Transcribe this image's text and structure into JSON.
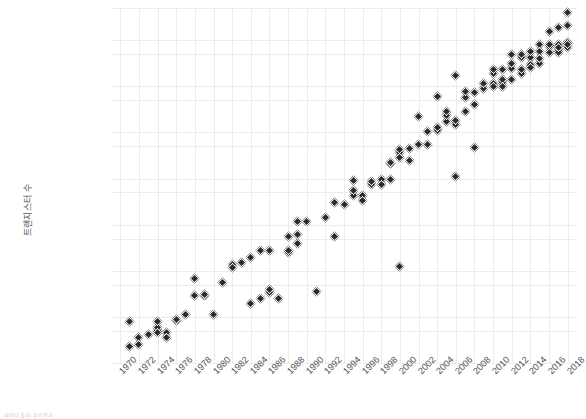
{
  "chart_data": {
    "type": "scatter",
    "title": "",
    "xlabel": "",
    "ylabel": "트랜지스터 수",
    "yscale": "log",
    "ylim": [
      1000,
      50000000000
    ],
    "xlim": [
      1969,
      2019
    ],
    "grid": true,
    "legend": null,
    "marker": "diamond",
    "marker_color": "#2b2b2b",
    "ytick_labels": [
      "50,000,000,000",
      "10,000,000,000",
      "5,000,000,000",
      "1,000,000,000",
      "500,000,000",
      "100,000,000",
      "50,000,000",
      "10,000,000",
      "5,000,000",
      "1,000,000",
      "500,000",
      "100,000",
      "50,000",
      "10,000",
      "5,000",
      "1,000"
    ],
    "ytick_values": [
      50000000000,
      10000000000,
      5000000000,
      1000000000,
      500000000,
      100000000,
      50000000,
      10000000,
      5000000,
      1000000,
      500000,
      100000,
      50000,
      10000,
      5000,
      1000
    ],
    "xtick_labels": [
      "1970",
      "1972",
      "1974",
      "1976",
      "1978",
      "1980",
      "1982",
      "1984",
      "1986",
      "1988",
      "1990",
      "1992",
      "1994",
      "1996",
      "1998",
      "2000",
      "2002",
      "2004",
      "2006",
      "2008",
      "2010",
      "2012",
      "2014",
      "2016",
      "2018"
    ],
    "xtick_values": [
      1970,
      1972,
      1974,
      1976,
      1978,
      1980,
      1982,
      1984,
      1986,
      1988,
      1990,
      1992,
      1994,
      1996,
      1998,
      2000,
      2002,
      2004,
      2006,
      2008,
      2010,
      2012,
      2014,
      2016,
      2018
    ],
    "points": [
      [
        1971,
        2250
      ],
      [
        1971,
        8000
      ],
      [
        1972,
        3500
      ],
      [
        1972,
        2500
      ],
      [
        1973,
        4100
      ],
      [
        1974,
        5000
      ],
      [
        1974,
        6000
      ],
      [
        1974,
        4500
      ],
      [
        1974,
        8000
      ],
      [
        1975,
        4528
      ],
      [
        1975,
        3510
      ],
      [
        1976,
        8500
      ],
      [
        1976,
        9000
      ],
      [
        1977,
        11000
      ],
      [
        1978,
        29000
      ],
      [
        1978,
        68000
      ],
      [
        1979,
        29000
      ],
      [
        1979,
        30000
      ],
      [
        1980,
        11500
      ],
      [
        1981,
        55000
      ],
      [
        1982,
        134000
      ],
      [
        1982,
        120000
      ],
      [
        1983,
        150000
      ],
      [
        1984,
        190000
      ],
      [
        1984,
        20000
      ],
      [
        1985,
        25000
      ],
      [
        1985,
        275000
      ],
      [
        1986,
        273000
      ],
      [
        1986,
        34000
      ],
      [
        1986,
        40000
      ],
      [
        1987,
        25000
      ],
      [
        1988,
        250000
      ],
      [
        1988,
        275000
      ],
      [
        1988,
        550000
      ],
      [
        1989,
        1180000
      ],
      [
        1989,
        390000
      ],
      [
        1989,
        600000
      ],
      [
        1990,
        1200000
      ],
      [
        1991,
        35000
      ],
      [
        1992,
        1400000
      ],
      [
        1993,
        3100000
      ],
      [
        1993,
        550000
      ],
      [
        1994,
        2800000
      ],
      [
        1995,
        4300000
      ],
      [
        1995,
        5500000
      ],
      [
        1995,
        9300000
      ],
      [
        1996,
        4300000
      ],
      [
        1996,
        3300000
      ],
      [
        1997,
        7500000
      ],
      [
        1997,
        8800000
      ],
      [
        1998,
        9500000
      ],
      [
        1998,
        7500000
      ],
      [
        1999,
        9500000
      ],
      [
        1999,
        21300000
      ],
      [
        1999,
        22000000
      ],
      [
        2000,
        37500000
      ],
      [
        2000,
        42000000
      ],
      [
        2000,
        28000000
      ],
      [
        2000,
        125000
      ],
      [
        2001,
        45000000
      ],
      [
        2001,
        25000000
      ],
      [
        2002,
        55000000
      ],
      [
        2002,
        220000000
      ],
      [
        2003,
        105000000
      ],
      [
        2003,
        54000000
      ],
      [
        2004,
        112000000
      ],
      [
        2004,
        125000000
      ],
      [
        2004,
        592000000
      ],
      [
        2005,
        169000000
      ],
      [
        2005,
        228000000
      ],
      [
        2005,
        291000000
      ],
      [
        2006,
        151000000
      ],
      [
        2006,
        184000000
      ],
      [
        2006,
        1700000000
      ],
      [
        2006,
        11000000
      ],
      [
        2007,
        291000000
      ],
      [
        2007,
        582000000
      ],
      [
        2007,
        789000000
      ],
      [
        2008,
        731000000
      ],
      [
        2008,
        410000000
      ],
      [
        2008,
        47000000
      ],
      [
        2009,
        904000000
      ],
      [
        2009,
        1170000000
      ],
      [
        2010,
        1170000000
      ],
      [
        2010,
        1900000000
      ],
      [
        2010,
        2300000000
      ],
      [
        2010,
        1000000000
      ],
      [
        2011,
        1200000000
      ],
      [
        2011,
        2270000000
      ],
      [
        2011,
        1400000000
      ],
      [
        2011,
        995000000
      ],
      [
        2012,
        1400000000
      ],
      [
        2012,
        2400000000
      ],
      [
        2012,
        3100000000
      ],
      [
        2012,
        5000000000
      ],
      [
        2013,
        1860000000
      ],
      [
        2013,
        4310000000
      ],
      [
        2013,
        5000000000
      ],
      [
        2013,
        2300000000
      ],
      [
        2014,
        4310000000
      ],
      [
        2014,
        5560000000
      ],
      [
        2014,
        3000000000
      ],
      [
        2014,
        2600000000
      ],
      [
        2015,
        8000000000
      ],
      [
        2015,
        5700000000
      ],
      [
        2015,
        3200000000
      ],
      [
        2015,
        4000000000
      ],
      [
        2016,
        7200000000
      ],
      [
        2016,
        15300000000
      ],
      [
        2016,
        8000000000
      ],
      [
        2016,
        5500000000
      ],
      [
        2017,
        19200000000
      ],
      [
        2017,
        8000000000
      ],
      [
        2017,
        6000000000
      ],
      [
        2017,
        5300000000
      ],
      [
        2017,
        7000000000
      ],
      [
        2018,
        21100000000
      ],
      [
        2018,
        39540000000
      ],
      [
        2018,
        9000000000
      ],
      [
        2018,
        6900000000
      ],
      [
        2018,
        8000000000
      ]
    ]
  },
  "footnote": {
    "text": "데이터 출처: 위키백과"
  }
}
